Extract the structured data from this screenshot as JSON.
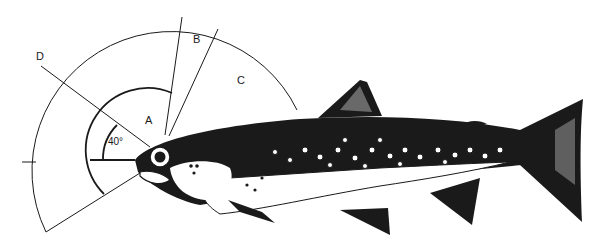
{
  "diagram": {
    "labels": {
      "a": "A",
      "b": "B",
      "c": "C",
      "d": "D",
      "angle": "40°"
    },
    "colors": {
      "ink": "#1a1a1a",
      "background": "#ffffff"
    }
  }
}
